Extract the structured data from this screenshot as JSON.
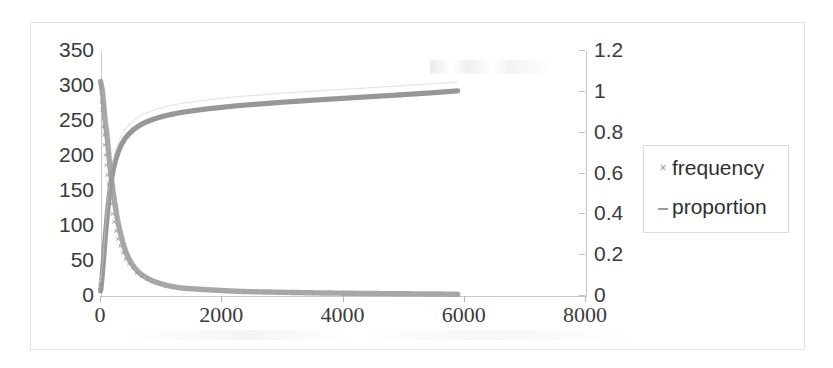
{
  "chart_data": {
    "type": "scatter",
    "title": "",
    "xlabel": "",
    "ylabel": "",
    "grid": false,
    "legend_position": "right",
    "xlim": [
      0,
      8000
    ],
    "xticks": [
      "0",
      "2000",
      "4000",
      "6000",
      "8000"
    ],
    "xtick_values": [
      0,
      2000,
      4000,
      6000,
      8000
    ],
    "ylim_left": [
      0,
      350
    ],
    "yticks_left": [
      "0",
      "50",
      "100",
      "150",
      "200",
      "250",
      "300",
      "350"
    ],
    "ytick_values_left": [
      0,
      50,
      100,
      150,
      200,
      250,
      300,
      350
    ],
    "ylim_right": [
      0,
      1.2
    ],
    "yticks_right": [
      "0",
      "0.2",
      "0.4",
      "0.6",
      "0.8",
      "1",
      "1.2"
    ],
    "ytick_values_right": [
      0,
      0.2,
      0.4,
      0.6,
      0.8,
      1,
      1.2
    ],
    "series": [
      {
        "name": "frequency",
        "axis": "left",
        "marker": "x",
        "color": "#9b9b9b",
        "x": [
          10,
          25,
          40,
          55,
          70,
          85,
          100,
          115,
          130,
          145,
          160,
          180,
          200,
          225,
          250,
          280,
          310,
          345,
          380,
          420,
          465,
          515,
          570,
          630,
          700,
          780,
          870,
          970,
          1080,
          1200,
          1340,
          1500,
          1680,
          1880,
          2100,
          2350,
          2620,
          2920,
          3250,
          3600,
          3980,
          4380,
          4800,
          5250,
          5700,
          5900
        ],
        "y": [
          305,
          298,
          292,
          278,
          262,
          250,
          238,
          228,
          215,
          200,
          188,
          172,
          158,
          142,
          128,
          112,
          98,
          86,
          74,
          63,
          54,
          46,
          39,
          33,
          28,
          24,
          20,
          17,
          14,
          12,
          10,
          9,
          8,
          7,
          6,
          5,
          4.5,
          4,
          3.5,
          3,
          2.6,
          2.2,
          1.9,
          1.6,
          1.3,
          1.0
        ]
      },
      {
        "name": "proportion",
        "axis": "right",
        "marker": "dash",
        "color": "#8e8e8e",
        "x": [
          10,
          25,
          40,
          60,
          80,
          100,
          125,
          150,
          180,
          215,
          255,
          300,
          350,
          410,
          480,
          560,
          650,
          750,
          870,
          1000,
          1150,
          1320,
          1520,
          1750,
          2000,
          2300,
          2650,
          3050,
          3500,
          4000,
          4550,
          5150,
          5600,
          5900
        ],
        "y": [
          0.02,
          0.06,
          0.11,
          0.18,
          0.26,
          0.33,
          0.41,
          0.48,
          0.55,
          0.61,
          0.66,
          0.7,
          0.735,
          0.765,
          0.79,
          0.812,
          0.83,
          0.846,
          0.86,
          0.872,
          0.883,
          0.893,
          0.902,
          0.911,
          0.919,
          0.928,
          0.936,
          0.945,
          0.954,
          0.963,
          0.973,
          0.984,
          0.993,
          1.0
        ]
      }
    ]
  },
  "legend": {
    "items": [
      {
        "label": "frequency",
        "marker": "×"
      },
      {
        "label": "proportion",
        "marker": "–"
      }
    ]
  },
  "colors": {
    "series_frequency": "#9b9b9b",
    "series_proportion": "#8e8e8e",
    "axis": "#c9c9c9",
    "text": "#3b3b3b",
    "frame": "#e2e2e2",
    "legend_border": "#dcdcdc",
    "background": "#ffffff"
  }
}
